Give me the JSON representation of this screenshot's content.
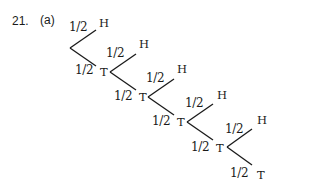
{
  "question": {
    "number": "21.",
    "part": "(a)"
  },
  "tree": {
    "levels": [
      {
        "vertex": [
          70,
          48
        ],
        "up_end": [
          96,
          30
        ],
        "down_end": [
          96,
          66
        ],
        "up_prob": "1/2",
        "up_outcome": "H",
        "down_prob": "1/2",
        "down_outcome": "T"
      },
      {
        "vertex": [
          110,
          72
        ],
        "up_end": [
          136,
          54
        ],
        "down_end": [
          136,
          90
        ],
        "up_prob": "1/2",
        "up_outcome": "H",
        "down_prob": "1/2",
        "down_outcome": "T"
      },
      {
        "vertex": [
          148,
          97
        ],
        "up_end": [
          174,
          79
        ],
        "down_end": [
          174,
          115
        ],
        "up_prob": "1/2",
        "up_outcome": "H",
        "down_prob": "1/2",
        "down_outcome": "T"
      },
      {
        "vertex": [
          187,
          122
        ],
        "up_end": [
          213,
          104
        ],
        "down_end": [
          213,
          140
        ],
        "up_prob": "1/2",
        "up_outcome": "H",
        "down_prob": "1/2",
        "down_outcome": "T"
      },
      {
        "vertex": [
          227,
          147
        ],
        "up_end": [
          252,
          129
        ],
        "down_end": [
          252,
          165
        ],
        "up_prob": "1/2",
        "up_outcome": "H",
        "down_prob": "1/2",
        "down_outcome": "T"
      }
    ]
  }
}
